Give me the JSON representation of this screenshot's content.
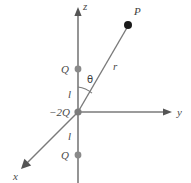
{
  "figure": {
    "background_color": "#ffffff",
    "line_color": "#7a7a7a",
    "text_color": "#4a4a4a",
    "dot_color_charge": "#8a8a8a",
    "dot_color_point": "#1a1a1a",
    "axes": [
      {
        "name": "z",
        "label": "z",
        "direction": "up"
      },
      {
        "name": "y",
        "label": "y",
        "direction": "right"
      },
      {
        "name": "x",
        "label": "x",
        "direction": "down-left"
      }
    ],
    "charges": [
      {
        "id": "upper-charge",
        "label": "Q",
        "position": "z = +l"
      },
      {
        "id": "center-charge",
        "label": "−2Q",
        "position": "origin"
      },
      {
        "id": "lower-charge",
        "label": "Q",
        "position": "z = −l"
      }
    ],
    "lengths": [
      {
        "id": "upper-length",
        "label": "l"
      },
      {
        "id": "lower-length",
        "label": "l"
      }
    ],
    "field_point": {
      "label": "P"
    },
    "radial_line": {
      "label": "r"
    },
    "angle": {
      "label": "θ"
    }
  }
}
